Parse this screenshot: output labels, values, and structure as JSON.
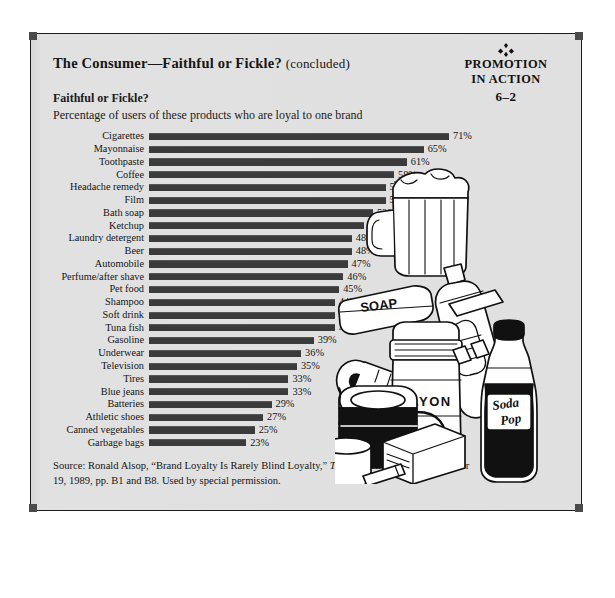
{
  "exhibit": {
    "title_main": "The Consumer—Faithful or Fickle?",
    "title_note": "(concluded)",
    "subtitle_heading": "Faithful or Fickle?",
    "subtitle_text": "Percentage of users of these products who are loyal to one brand"
  },
  "badge": {
    "ornament": "⁘",
    "line1": "PROMOTION",
    "line2": "IN ACTION",
    "line3": "6–2"
  },
  "source": {
    "line1_prefix": "Source: Ronald Alsop, “Brand Loyalty Is Rarely Blind Loyalty,” ",
    "line1_italic": "The Wall Street Journal,",
    "line2": "October 19, 1989, pp. B1 and B8. Used by special permission."
  },
  "illustration": {
    "items": [
      "beer-mug",
      "soap-bar",
      "toothpaste-tube",
      "film-roll",
      "mayonnaise-jar",
      "coffee-pot",
      "coffee-cup",
      "soda-pop-bottle",
      "cigarette-pack"
    ],
    "labels": {
      "soap": "SOAP",
      "mayonnaise": "MAYON",
      "soda": "Soda Pop"
    }
  },
  "colors": {
    "bar": "#3b3b3b",
    "frame": "#1c1c1c",
    "panel_bg": "#dedede",
    "text": "#141414"
  },
  "chart_data": {
    "type": "bar",
    "orientation": "horizontal",
    "title": "Faithful or Fickle?",
    "subtitle": "Percentage of users of these products who are loyal to one brand",
    "xlabel": "",
    "ylabel": "",
    "xlim": [
      0,
      71
    ],
    "grid": false,
    "legend": false,
    "value_suffix": "%",
    "categories": [
      "Cigarettes",
      "Mayonnaise",
      "Toothpaste",
      "Coffee",
      "Headache remedy",
      "Film",
      "Bath soap",
      "Ketchup",
      "Laundry detergent",
      "Beer",
      "Automobile",
      "Perfume/after shave",
      "Pet food",
      "Shampoo",
      "Soft drink",
      "Tuna fish",
      "Gasoline",
      "Underwear",
      "Television",
      "Tires",
      "Blue jeans",
      "Batteries",
      "Athletic shoes",
      "Canned vegetables",
      "Garbage bags"
    ],
    "values": [
      71,
      65,
      61,
      58,
      56,
      56,
      53,
      51,
      48,
      48,
      47,
      46,
      45,
      44,
      44,
      44,
      39,
      36,
      35,
      33,
      33,
      29,
      27,
      25,
      23
    ],
    "value_labels": [
      "71%",
      "65%",
      "61%",
      "58%",
      "56%",
      "56%",
      "53%",
      "51%",
      "48%",
      "48%",
      "47%",
      "46%",
      "45%",
      "44%",
      "44%",
      "44%",
      "39%",
      "36%",
      "35%",
      "33%",
      "33%",
      "29%",
      "27%",
      "25%",
      "23%"
    ]
  }
}
